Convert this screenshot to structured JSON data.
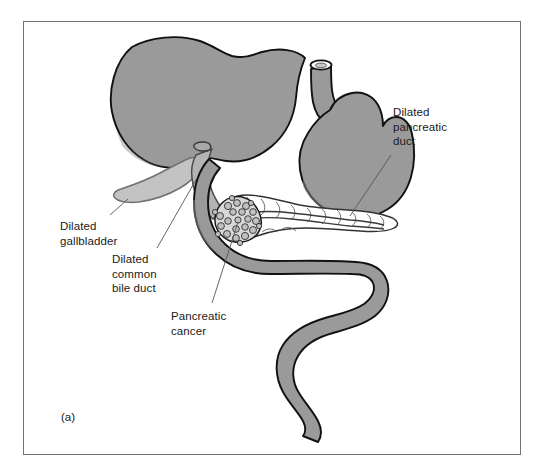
{
  "figure": {
    "domain": "medical-anatomical-illustration",
    "panel_caption": "(a)",
    "frame": {
      "border_color": "#6f7275",
      "background_color": "#ffffff"
    }
  },
  "labels": [
    {
      "id": "dilated-pancreatic-duct",
      "lines": [
        "Dilated",
        "pancreatic",
        "duct"
      ],
      "text": "Dilated pancreatic duct",
      "leader_from": [
        391,
        155
      ],
      "leader_to": [
        348,
        216
      ]
    },
    {
      "id": "dilated-gallbladder",
      "lines": [
        "Dilated",
        "gallbladder"
      ],
      "text": "Dilated gallbladder",
      "leader_from": [
        110,
        216
      ],
      "leader_to": [
        128,
        199
      ]
    },
    {
      "id": "dilated-common-bile-duct",
      "lines": [
        "Dilated",
        "common",
        "bile duct"
      ],
      "text": "Dilated common bile duct",
      "leader_from": [
        156,
        249
      ],
      "leader_to": [
        196,
        178
      ]
    },
    {
      "id": "pancreatic-cancer",
      "lines": [
        "Pancreatic",
        "cancer"
      ],
      "text": "Pancreatic cancer",
      "leader_from": [
        211,
        304
      ],
      "leader_to": [
        237,
        222
      ]
    }
  ],
  "structures": [
    {
      "id": "liver",
      "name": "Liver",
      "fill": "#9a9a9a",
      "stroke": "#111111",
      "note": "Large dark-grey organ occupying the upper left of the illustration"
    },
    {
      "id": "gallbladder",
      "name": "Dilated gallbladder",
      "fill": "#c3c3c3",
      "stroke": "#6f7275",
      "note": "Lighter grey distended pear-shaped sac beneath the liver"
    },
    {
      "id": "common-bile-duct",
      "name": "Dilated common bile duct",
      "fill": "#b4b4b4",
      "stroke": "#4a4a4a",
      "note": "Widened tube descending from the liver hilum toward the duodenum"
    },
    {
      "id": "stomach",
      "name": "Stomach",
      "fill": "#9a9a9a",
      "stroke": "#111111",
      "note": "Grey J-shaped organ on the right with the oesophagus entering at the top"
    },
    {
      "id": "oesophagus",
      "name": "Oesophagus",
      "fill": "#9a9a9a",
      "stroke": "#111111",
      "note": "Cut tube at the top of the stomach with an elliptical open lumen"
    },
    {
      "id": "duodenum",
      "name": "Duodenum and proximal small bowel",
      "fill": "#9a9a9a",
      "stroke": "#111111",
      "note": "C-loop around the pancreatic head continuing as an S-shaped bowel tube"
    },
    {
      "id": "pancreas",
      "name": "Pancreas",
      "fill": "#ffffff",
      "stroke": "#333333",
      "note": "White lobulated gland lying transversely behind the stomach"
    },
    {
      "id": "pancreatic-duct",
      "name": "Dilated pancreatic duct",
      "fill": "#ffffff",
      "stroke": "#3a3a3a",
      "note": "Widened channel running along the length of the pancreas"
    },
    {
      "id": "tumour",
      "name": "Pancreatic cancer",
      "fill": "#d8d8d8",
      "stroke": "#1a1a1a",
      "note": "Irregular cauliflower-like mass in the head of the pancreas"
    }
  ],
  "colors": {
    "organ_grey": "#9a9a9a",
    "gallbladder_grey": "#c3c3c3",
    "tumour_grey": "#d8d8d8",
    "outline_black": "#111111",
    "frame_grey": "#6f7275",
    "leader_line": "#555555",
    "text": "#1a1a1a",
    "background": "#ffffff"
  }
}
